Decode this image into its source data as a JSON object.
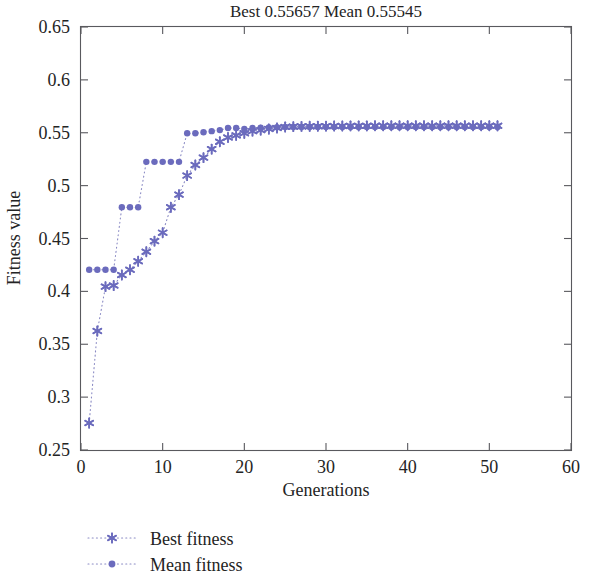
{
  "chart_data": {
    "type": "line",
    "title": "Best 0.55657 Mean 0.55545",
    "xlabel": "Generations",
    "ylabel": "Fitness value",
    "xlim": [
      0,
      60
    ],
    "ylim": [
      0.25,
      0.65
    ],
    "xticks": [
      0,
      10,
      20,
      30,
      40,
      50,
      60
    ],
    "xtick_labels": [
      "0",
      "10",
      "20",
      "30",
      "40",
      "50",
      "60"
    ],
    "yticks": [
      0.25,
      0.3,
      0.35,
      0.4,
      0.45,
      0.5,
      0.55,
      0.6,
      0.65
    ],
    "ytick_labels": [
      "0.25",
      "0.3",
      "0.35",
      "0.4",
      "0.45",
      "0.5",
      "0.55",
      "0.6",
      "0.65"
    ],
    "grid": false,
    "legend_position": "below-left",
    "marker_color": "#6b6bbd",
    "line_color": "#8a8ac4",
    "x": [
      1,
      2,
      3,
      4,
      5,
      6,
      7,
      8,
      9,
      10,
      11,
      12,
      13,
      14,
      15,
      16,
      17,
      18,
      19,
      20,
      21,
      22,
      23,
      24,
      25,
      26,
      27,
      28,
      29,
      30,
      31,
      32,
      33,
      34,
      35,
      36,
      37,
      38,
      39,
      40,
      41,
      42,
      43,
      44,
      45,
      46,
      47,
      48,
      49,
      50,
      51
    ],
    "series": [
      {
        "name": "Best fitness",
        "marker": "asterisk",
        "values": [
          0.2755,
          0.3625,
          0.4045,
          0.4055,
          0.4155,
          0.4205,
          0.4285,
          0.4375,
          0.4475,
          0.4555,
          0.4795,
          0.4915,
          0.5095,
          0.5195,
          0.5265,
          0.5345,
          0.5415,
          0.5455,
          0.5475,
          0.5495,
          0.5515,
          0.5525,
          0.5535,
          0.5545,
          0.5555,
          0.5558,
          0.556,
          0.5561,
          0.5562,
          0.5563,
          0.5564,
          0.5564,
          0.5565,
          0.5565,
          0.5565,
          0.5566,
          0.5566,
          0.5566,
          0.5566,
          0.5566,
          0.5566,
          0.5566,
          0.5566,
          0.5566,
          0.5566,
          0.5566,
          0.5566,
          0.5566,
          0.5566,
          0.5566,
          0.55657
        ]
      },
      {
        "name": "Mean fitness",
        "marker": "dot",
        "values": [
          0.4205,
          0.4205,
          0.4205,
          0.4205,
          0.4795,
          0.4795,
          0.4795,
          0.5225,
          0.5225,
          0.5225,
          0.5225,
          0.5225,
          0.5495,
          0.5495,
          0.5505,
          0.5515,
          0.5525,
          0.5545,
          0.5545,
          0.5535,
          0.5545,
          0.5548,
          0.5551,
          0.5553,
          0.5554,
          0.5554,
          0.5554,
          0.5554,
          0.5554,
          0.5554,
          0.5554,
          0.5554,
          0.5554,
          0.5554,
          0.5554,
          0.5554,
          0.5554,
          0.5554,
          0.5554,
          0.5554,
          0.5554,
          0.5554,
          0.5554,
          0.5554,
          0.5554,
          0.5554,
          0.5554,
          0.5554,
          0.5554,
          0.5554,
          0.55545
        ]
      }
    ],
    "legend": [
      {
        "label": "Best fitness",
        "marker": "asterisk"
      },
      {
        "label": "Mean fitness",
        "marker": "dot"
      }
    ]
  }
}
